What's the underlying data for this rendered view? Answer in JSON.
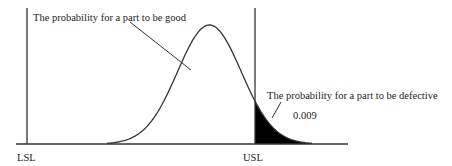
{
  "diagram": {
    "type": "normal-distribution-spec-limits",
    "labels": {
      "lsl": "LSL",
      "usl": "USL",
      "good_annotation": "The probability for a part to be good",
      "defective_annotation": "The probability for a part to be defective",
      "defective_value": "0.009"
    },
    "distribution": {
      "mean_relative_to_limits": 0.8,
      "sd_relative_to_limits": 0.14,
      "defect_probability": 0.009
    },
    "colors": {
      "line": "#333333",
      "tail_fill": "#000000",
      "text": "#222222",
      "background": "#ffffff"
    }
  }
}
